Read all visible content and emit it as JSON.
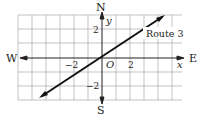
{
  "compass": {
    "north": "N",
    "south": "S",
    "east": "E",
    "west": "W"
  },
  "axes": {
    "x_label": "x",
    "y_label": "y",
    "origin_label": "O"
  },
  "ticks": {
    "x_neg": "−2",
    "x_pos": "2",
    "y_pos": "2",
    "y_neg": "−2"
  },
  "line": {
    "label": "Route 3",
    "color": "#111111"
  },
  "grid": {
    "color": "#999999"
  }
}
